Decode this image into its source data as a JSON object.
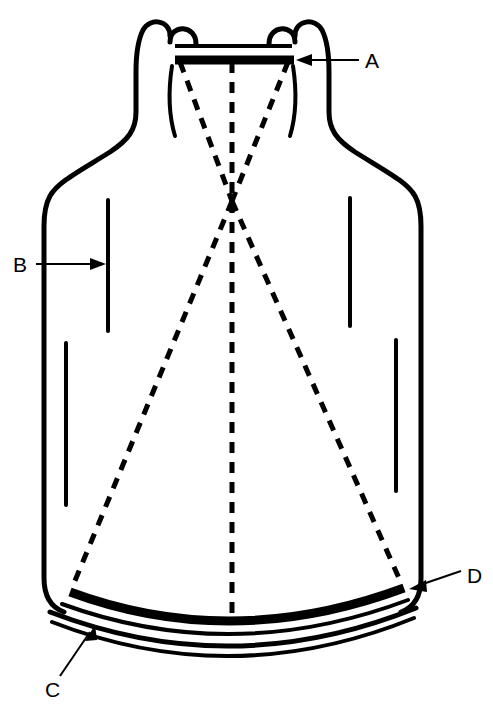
{
  "diagram": {
    "background_color": "#ffffff",
    "ink_color": "#000000",
    "callouts": [
      {
        "id": "A",
        "label": "A",
        "target": "neck-silvered-mirror-bar",
        "label_x": 365,
        "label_y": 68,
        "leader_from_x": 359,
        "leader_from_y": 60,
        "leader_to_x": 296,
        "leader_to_y": 60,
        "arrow_direction": "left"
      },
      {
        "id": "B",
        "label": "B",
        "target": "inner-wall-line-left-upper",
        "label_x": 13,
        "label_y": 272,
        "leader_from_x": 36,
        "leader_from_y": 264,
        "leader_to_x": 106,
        "leader_to_y": 264,
        "arrow_direction": "right"
      },
      {
        "id": "C",
        "label": "C",
        "target": "outer-bottom-wall",
        "label_x": 45,
        "label_y": 697,
        "leader_from_x": 60,
        "leader_from_y": 676,
        "leader_to_x": 95,
        "leader_to_y": 625,
        "arrow_direction": "up-right"
      },
      {
        "id": "D",
        "label": "D",
        "target": "bottom-silvered-mirror-arc",
        "label_x": 467,
        "label_y": 583,
        "leader_from_x": 461,
        "leader_from_y": 571,
        "leader_to_x": 409,
        "leader_to_y": 589,
        "arrow_direction": "down-left"
      }
    ],
    "ray_paths": {
      "focal_point_x": 232,
      "focal_point_y": 201,
      "center_axis_x": 232,
      "center_axis_top_y": 62,
      "center_axis_bottom_y": 617,
      "dash_pattern": "11 9",
      "dash_width": 5
    },
    "parts": {
      "neck_lip_left": "neck-lip-left",
      "neck_lip_right": "neck-lip-right",
      "thin_bar": "neck-thin-bar",
      "thick_bar": "neck-thick-bar",
      "bottom_mirror": "bottom-mirror-arc",
      "bottom_inner_wall": "bottom-inner-wall-arc",
      "bottom_outer_wall": "bottom-outer-wall-arc"
    },
    "wall_lines": [
      {
        "name": "inner-wall-line-left-upper",
        "x": 108,
        "y1": 200,
        "y2": 331
      },
      {
        "name": "inner-wall-line-left-lower",
        "x": 66,
        "y1": 343,
        "y2": 505
      },
      {
        "name": "inner-wall-line-right-upper",
        "x": 350,
        "y1": 198,
        "y2": 326
      },
      {
        "name": "inner-wall-line-right-lower",
        "x": 396,
        "y1": 340,
        "y2": 491
      }
    ]
  }
}
